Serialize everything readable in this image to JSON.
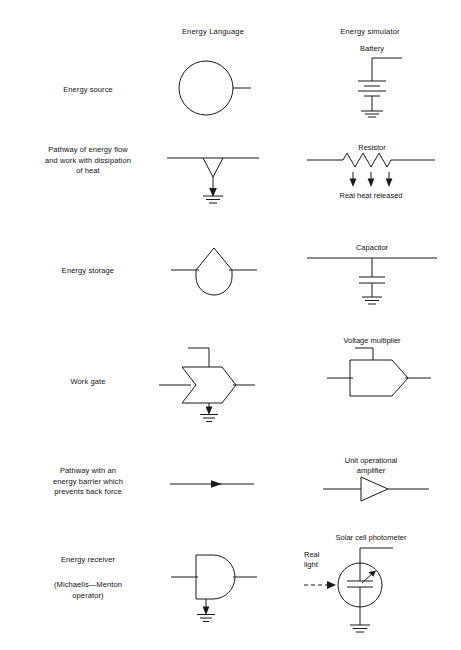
{
  "figure": {
    "columns": [
      {
        "id": "label",
        "header": ""
      },
      {
        "id": "energy_language",
        "header": "Energy Language"
      },
      {
        "id": "energy_simulator",
        "header": "Energy simulator"
      }
    ],
    "rows": [
      {
        "label_lines": [
          "Energy source"
        ],
        "energy_language": {
          "symbol": "circle-source",
          "caption": ""
        },
        "energy_simulator": {
          "symbol": "battery-to-ground",
          "caption": "Battery"
        }
      },
      {
        "label_lines": [
          "Pathway of energy flow",
          "and work with dissipation",
          "of heat"
        ],
        "energy_language": {
          "symbol": "heat-sink-pathway",
          "caption": ""
        },
        "energy_simulator": {
          "symbol": "resistor-with-heat-arrows",
          "caption": "Resistor",
          "caption_bottom": "Real heat released"
        }
      },
      {
        "label_lines": [
          "Energy storage"
        ],
        "energy_language": {
          "symbol": "storage-tank",
          "caption": ""
        },
        "energy_simulator": {
          "symbol": "capacitor-to-ground",
          "caption": "Capacitor"
        }
      },
      {
        "label_lines": [
          "Work gate"
        ],
        "energy_language": {
          "symbol": "work-gate",
          "caption": ""
        },
        "energy_simulator": {
          "symbol": "voltage-multiplier-pentagon",
          "caption": "Voltage multiplier"
        }
      },
      {
        "label_lines": [
          "Pathway with an",
          "energy barrier which",
          "prevents back force"
        ],
        "energy_language": {
          "symbol": "one-way-arrow-line",
          "caption": ""
        },
        "energy_simulator": {
          "symbol": "operational-amplifier-triangle",
          "caption_lines": [
            "Unit operational",
            "amplifier"
          ]
        }
      },
      {
        "label_lines": [
          "Energy receiver"
        ],
        "label_lines_secondary": [
          "(Michaelis—Menton",
          "operator)"
        ],
        "energy_language": {
          "symbol": "receiver-bullet",
          "caption": ""
        },
        "energy_simulator": {
          "symbol": "solar-cell-photometer",
          "caption": "Solar cell photometer",
          "input_label_lines": [
            "Real",
            "light"
          ]
        }
      }
    ],
    "style": {
      "line_color": "#1a1a1a",
      "background": "#ffffff"
    }
  }
}
